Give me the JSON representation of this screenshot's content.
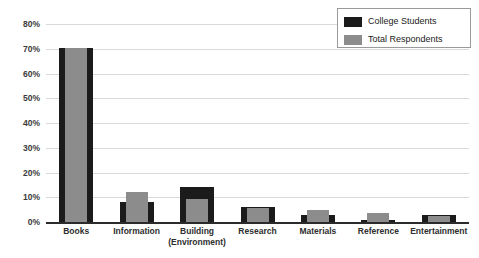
{
  "chart_data": {
    "type": "bar",
    "title": "",
    "xlabel": "",
    "ylabel": "",
    "ylim": [
      0,
      80
    ],
    "grid": true,
    "legend_position": "top-right",
    "tick_format": "percent",
    "categories": [
      "Books",
      "Information",
      "Building (Environment)",
      "Research",
      "Materials",
      "Reference",
      "Entertainment"
    ],
    "category_lines": [
      [
        "Books",
        ""
      ],
      [
        "Information",
        ""
      ],
      [
        "Building",
        "(Environment)"
      ],
      [
        "Research",
        ""
      ],
      [
        "Materials",
        ""
      ],
      [
        "Reference",
        ""
      ],
      [
        "Entertainment",
        ""
      ]
    ],
    "yticks": [
      "0%",
      "10%",
      "20%",
      "30%",
      "40%",
      "50%",
      "60%",
      "70%",
      "80%"
    ],
    "ytick_values": [
      0,
      10,
      20,
      30,
      40,
      50,
      60,
      70,
      80
    ],
    "series": [
      {
        "name": "College Students",
        "color": "#1b1b1b",
        "values": [
          70.5,
          8,
          14,
          6,
          3,
          1,
          3
        ]
      },
      {
        "name": "Total Respondents",
        "color": "#8c8c8c",
        "values": [
          70.5,
          12,
          9.5,
          5.5,
          5,
          3.5,
          2.5
        ]
      }
    ]
  },
  "legend": {
    "items": [
      {
        "label": "College Students",
        "color": "#1b1b1b"
      },
      {
        "label": "Total Respondents",
        "color": "#8c8c8c"
      }
    ]
  },
  "colors": {
    "gridline": "#d9d9d9",
    "axis": "#2b2b2b",
    "text": "#2e2e2e",
    "background": "#ffffff"
  }
}
